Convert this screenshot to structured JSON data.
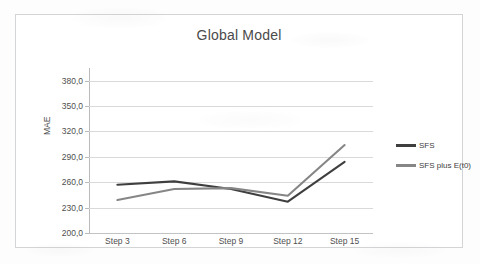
{
  "chart_data": {
    "type": "line",
    "title": "Global Model",
    "xlabel": "",
    "ylabel": "MAE",
    "categories": [
      "Step 3",
      "Step 6",
      "Step 9",
      "Step 12",
      "Step 15"
    ],
    "ylim": [
      200.0,
      395.0
    ],
    "ytick_labels": [
      "380,0",
      "350,0",
      "320,0",
      "290,0",
      "260,0",
      "230,0",
      "200,0"
    ],
    "ytick_values": [
      380.0,
      350.0,
      320.0,
      290.0,
      260.0,
      230.0,
      200.0
    ],
    "grid": true,
    "legend_position": "right",
    "series": [
      {
        "name": "SFS",
        "color": "#3f3f3f",
        "values": [
          257,
          261,
          252,
          237,
          284
        ]
      },
      {
        "name": "SFS plus E(t0)",
        "color": "#868686",
        "values": [
          239,
          252,
          253,
          244,
          304
        ]
      }
    ]
  },
  "colors": {
    "frame_border": "#d3d4d6",
    "gridline": "#d8d9db",
    "axis": "#b9babc",
    "title_text": "#4a4a4a",
    "tick_text": "#4f4f4f",
    "series_sfs": "#3f3f3f",
    "series_sfs_plus": "#868686",
    "page_background": "#fdfdfd"
  }
}
